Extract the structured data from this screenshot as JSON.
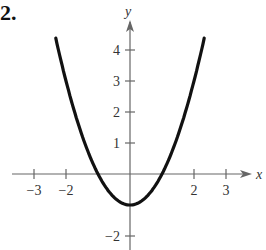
{
  "problem_number": "2.",
  "chart_data": {
    "type": "line",
    "title": "",
    "xlabel": "x",
    "ylabel": "y",
    "function": "y = x^2 - 1",
    "xlim": [
      -3.5,
      3.6
    ],
    "ylim": [
      -2.4,
      4.8
    ],
    "x_ticks": [
      -3,
      -2,
      2,
      3
    ],
    "y_ticks": [
      4,
      3,
      2,
      1,
      -2
    ],
    "x_tick_labels": [
      "−3",
      "−2",
      "2",
      "3"
    ],
    "y_tick_labels": [
      "4",
      "3",
      "2",
      "1",
      "−2"
    ],
    "grid": false,
    "series": [
      {
        "name": "curve",
        "x": [
          -2.3,
          -2,
          -1.5,
          -1,
          -0.5,
          0,
          0.5,
          1,
          1.5,
          2,
          2.3
        ],
        "values": [
          4.29,
          3,
          1.25,
          0,
          -0.75,
          -1,
          -0.75,
          0,
          1.25,
          3,
          4.29
        ]
      }
    ],
    "vertex": [
      0,
      -1
    ],
    "x_intercepts": [
      -1,
      1
    ]
  }
}
